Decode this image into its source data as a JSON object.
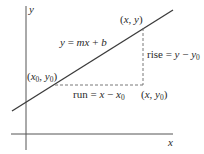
{
  "diagram": {
    "axes": {
      "x_label": "x",
      "y_label": "y"
    },
    "line": {
      "equation_lhs": "y",
      "equation_eq": " = ",
      "equation_m": "mx",
      "equation_plus": " + ",
      "equation_b": "b"
    },
    "points": {
      "p0": {
        "open": "(",
        "x": "x",
        "x_sub": "0",
        "sep": ", ",
        "y": "y",
        "y_sub": "0",
        "close": ")"
      },
      "p1": {
        "open": "(",
        "x": "x",
        "sep": ", ",
        "y": "y",
        "close": ")"
      },
      "corner": {
        "open": "(",
        "x": "x",
        "sep": ", ",
        "y": "y",
        "y_sub": "0",
        "close": ")"
      }
    },
    "rise": {
      "word": "rise",
      "eq": " = ",
      "a": "y",
      "minus": " − ",
      "b": "y",
      "b_sub": "0"
    },
    "run": {
      "word": "run",
      "eq": " = ",
      "a": "x",
      "minus": " − ",
      "b": "x",
      "b_sub": "0"
    },
    "colors": {
      "line": "#3a3a3a",
      "axis": "#555555",
      "dashed": "#6a6a6a",
      "text": "#2a2a2a"
    }
  }
}
